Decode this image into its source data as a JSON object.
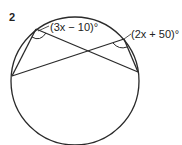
{
  "question_number": "2",
  "labels": {
    "angle_left": "(3x − 10)°",
    "angle_right": "(2x + 50)°"
  },
  "colors": {
    "stroke": "#2a2a2a",
    "background": "#ffffff"
  }
}
